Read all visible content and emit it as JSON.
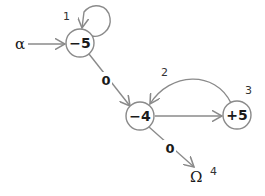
{
  "diagram": {
    "type": "state-machine",
    "start_symbol": "α",
    "end_symbol": "Ω",
    "nodes": [
      {
        "id": "1",
        "label": "−5",
        "state_number": "1"
      },
      {
        "id": "2",
        "label": "−4",
        "state_number": "2"
      },
      {
        "id": "3",
        "label": "+5",
        "state_number": "3"
      }
    ],
    "terminal": {
      "label": "Ω",
      "state_number": "4"
    },
    "edges": [
      {
        "from": "α",
        "to": "1",
        "label": ""
      },
      {
        "from": "1",
        "to": "1",
        "label": "",
        "type": "self-loop"
      },
      {
        "from": "1",
        "to": "2",
        "label": "0"
      },
      {
        "from": "2",
        "to": "3",
        "label": ""
      },
      {
        "from": "3",
        "to": "2",
        "label": "",
        "type": "arc"
      },
      {
        "from": "2",
        "to": "Ω",
        "label": "0"
      }
    ]
  },
  "colors": {
    "stroke": "#8a8a8a",
    "text": "#1a1a1a",
    "background": "#ffffff"
  }
}
